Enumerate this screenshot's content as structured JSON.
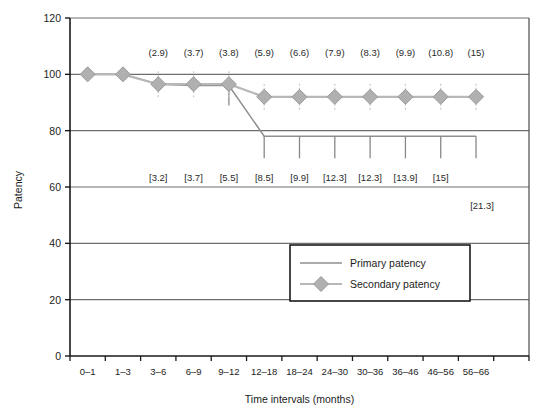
{
  "chart_data": {
    "type": "line",
    "title": "",
    "xlabel": "Time intervals (months)",
    "ylabel": "Patency",
    "ylim": [
      0,
      120
    ],
    "ytick_values": [
      0,
      20,
      40,
      60,
      80,
      100,
      120
    ],
    "ytick_labels": [
      "0",
      "20",
      "40",
      "60",
      "80",
      "100",
      "120"
    ],
    "grid": true,
    "legend_position": "inside-lower-right",
    "categories": [
      "0–1",
      "1–3",
      "3–6",
      "6–9",
      "9–12",
      "12–18",
      "18–24",
      "24–30",
      "30–36",
      "36–46",
      "46–56",
      "56–66"
    ],
    "series": [
      {
        "name": "Primary patency",
        "marker": "none",
        "color": "#8f8f8f",
        "values": [
          100,
          100,
          96.5,
          96,
          96,
          78,
          78,
          78,
          78,
          78,
          78,
          78
        ]
      },
      {
        "name": "Secondary patency",
        "marker": "diamond",
        "color": "#b3b3b3",
        "values": [
          100,
          100,
          96.5,
          96.5,
          96.5,
          92,
          92,
          92,
          92,
          92,
          92,
          92
        ]
      }
    ],
    "annotations_top": {
      "format": "(n)",
      "note": "Values in parentheses above the plot",
      "items": [
        {
          "category": "3–6",
          "label": "(2.9)"
        },
        {
          "category": "6–9",
          "label": "(3.7)"
        },
        {
          "category": "9–12",
          "label": "(3.8)"
        },
        {
          "category": "12–18",
          "label": "(5.9)"
        },
        {
          "category": "18–24",
          "label": "(6.6)"
        },
        {
          "category": "24–30",
          "label": "(7.9)"
        },
        {
          "category": "30–36",
          "label": "(8.3)"
        },
        {
          "category": "36–46",
          "label": "(9.9)"
        },
        {
          "category": "46–56",
          "label": "(10.8)"
        },
        {
          "category": "56–66",
          "label": "(15)"
        }
      ]
    },
    "annotations_bottom": {
      "format": "[n]",
      "note": "Values in square brackets within the plot",
      "items": [
        {
          "category": "3–6",
          "label": "[3.2]"
        },
        {
          "category": "6–9",
          "label": "[3.7]"
        },
        {
          "category": "9–12",
          "label": "[5.5]"
        },
        {
          "category": "12–18",
          "label": "[8.5]"
        },
        {
          "category": "18–24",
          "label": "[9.9]"
        },
        {
          "category": "24–30",
          "label": "[12.3]"
        },
        {
          "category": "30–36",
          "label": "[12.3]"
        },
        {
          "category": "36–46",
          "label": "[13.9]"
        },
        {
          "category": "46–56",
          "label": "[15]"
        }
      ]
    },
    "annotations_extra": [
      {
        "label": "[21.3]",
        "category": "56–66",
        "position": "below-plot-right"
      }
    ]
  },
  "legend": {
    "entries": [
      {
        "label": "Primary patency",
        "marker": "line"
      },
      {
        "label": "Secondary patency",
        "marker": "diamond-line"
      }
    ]
  },
  "colors": {
    "primary_line": "#8f8f8f",
    "secondary_line": "#b8b8b8",
    "marker_fill": "#b0b0b0",
    "marker_stroke": "#9a9a9a",
    "grid": "#6e6e6e",
    "axis": "#1a1a1a",
    "plot_border": "#4a4a4a",
    "background": "#ffffff"
  }
}
